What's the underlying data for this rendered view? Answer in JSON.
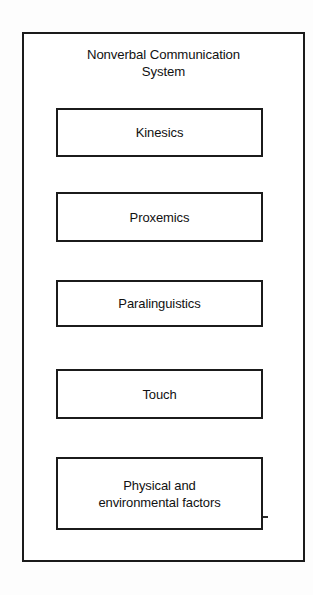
{
  "figure": {
    "background_color": "#fdfdfd",
    "line_color": "#1b1b1b",
    "text_color": "#111111"
  },
  "diagram": {
    "title": "Nonverbal Communication\nSystem",
    "title_line_1": "Nonverbal Communication",
    "title_line_2": "System",
    "components": [
      {
        "label": "Kinesics"
      },
      {
        "label": "Proxemics"
      },
      {
        "label": "Paralinguistics"
      },
      {
        "label": "Touch"
      },
      {
        "label": "Physical and\nenvironmental factors"
      }
    ]
  }
}
